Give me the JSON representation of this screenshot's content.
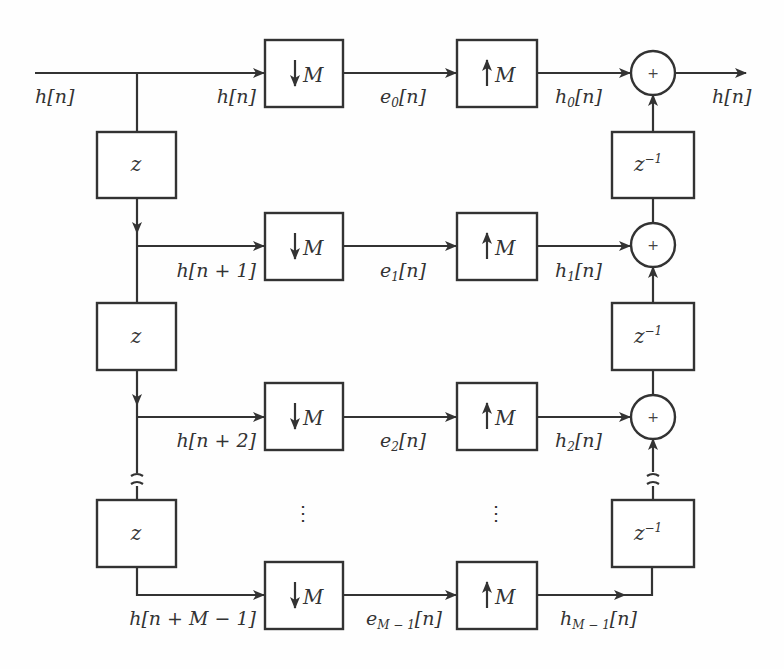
{
  "diagram": {
    "input_label": "h[n]",
    "output_label": "h[n]",
    "delay_block": "z",
    "advance_block": "z",
    "inverse_delay_block": "z",
    "inverse_delay_exp": "−1",
    "downsampler": "M",
    "upsampler": "M",
    "sum_symbol": "+",
    "ellipsis": "⋮",
    "branches": [
      {
        "input": "h[n]",
        "poly": "e",
        "poly_sub": "0",
        "up_out": "h",
        "up_sub": "0"
      },
      {
        "input": "h[n + 1]",
        "poly": "e",
        "poly_sub": "1",
        "up_out": "h",
        "up_sub": "1"
      },
      {
        "input": "h[n + 2]",
        "poly": "e",
        "poly_sub": "2",
        "up_out": "h",
        "up_sub": "2"
      },
      {
        "input": "h[n + M − 1]",
        "poly": "e",
        "poly_sub": "M − 1",
        "up_out": "h",
        "up_sub": "M − 1"
      }
    ],
    "arg": "[n]"
  },
  "colors": {
    "stroke": "#333333",
    "background": "#ffffff"
  }
}
